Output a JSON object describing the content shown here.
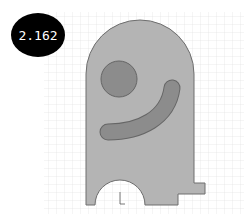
{
  "value_badge": {
    "text": "2.162",
    "bg_color": "#000000",
    "text_color": "#ffffff"
  },
  "sketch": {
    "grid_color": "#d8d8d8",
    "part_fill": "#b4b4b4",
    "part_stroke": "#707070",
    "hole_fill": "#8a8a8a",
    "slot_fill": "#8a8a8a",
    "features": [
      "outer-profile",
      "circular-hole",
      "curved-slot",
      "semicircle-cutout",
      "step-tab",
      "origin-axes"
    ]
  }
}
